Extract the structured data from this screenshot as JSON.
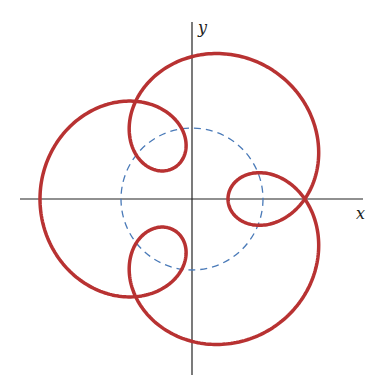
{
  "chart_data": {
    "type": "line",
    "title": "",
    "xlabel": "x",
    "ylabel": "y",
    "grid": false,
    "legend": null,
    "origin_px": [
      192,
      199
    ],
    "axes": {
      "x_axis": {
        "from": [
          20,
          199
        ],
        "to": [
          363,
          199
        ]
      },
      "y_axis": {
        "from": [
          192,
          22
        ],
        "to": [
          192,
          375
        ]
      }
    },
    "series": [
      {
        "name": "curve",
        "kind": "parametric",
        "equation": "x = 94 cos t - 58 cos 4t, y = 94 sin t - 58 sin 4t",
        "params": {
          "a": 94,
          "d": 58,
          "k": 4,
          "t_min": 0,
          "t_max": 6.2832,
          "samples": 720
        },
        "color": "#b83232",
        "stroke_width": 3.5
      },
      {
        "name": "fixed-circle",
        "kind": "circle",
        "center": [
          0,
          0
        ],
        "radius": 71,
        "color": "#4a7ab8",
        "dashed": true
      }
    ]
  },
  "labels": {
    "x": "x",
    "y": "y"
  },
  "colors": {
    "curve": "#b83232",
    "circle": "#4a7ab8",
    "axis": "#222222"
  }
}
